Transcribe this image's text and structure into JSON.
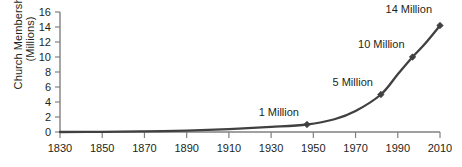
{
  "chart_data": {
    "type": "line",
    "title": "",
    "xlabel": "",
    "ylabel_line1": "Church Membership",
    "ylabel_line2": "(Millions)",
    "xlim": [
      1830,
      2010
    ],
    "ylim": [
      0,
      16
    ],
    "grid": false,
    "legend": "none",
    "xticks": [
      1830,
      1850,
      1870,
      1890,
      1910,
      1930,
      1950,
      1970,
      1990,
      2010
    ],
    "yticks": [
      0,
      2,
      4,
      6,
      8,
      10,
      12,
      14,
      16
    ],
    "x": [
      1830,
      1850,
      1870,
      1890,
      1910,
      1930,
      1947,
      1960,
      1970,
      1982,
      1990,
      1997,
      2003,
      2010
    ],
    "values": [
      0.0,
      0.03,
      0.09,
      0.19,
      0.39,
      0.67,
      1.0,
      1.7,
      2.8,
      5.0,
      7.7,
      10.0,
      11.8,
      14.2
    ],
    "markers": [
      {
        "x": 1947,
        "y": 1.0,
        "label": "1 Million"
      },
      {
        "x": 1982,
        "y": 5.0,
        "label": "5 Million"
      },
      {
        "x": 1997,
        "y": 10.0,
        "label": "10 Million"
      },
      {
        "x": 2010,
        "y": 14.2,
        "label": "14 Million"
      }
    ],
    "series_color": "#404040",
    "axis_color": "#808080",
    "text_color": "#231f20"
  }
}
